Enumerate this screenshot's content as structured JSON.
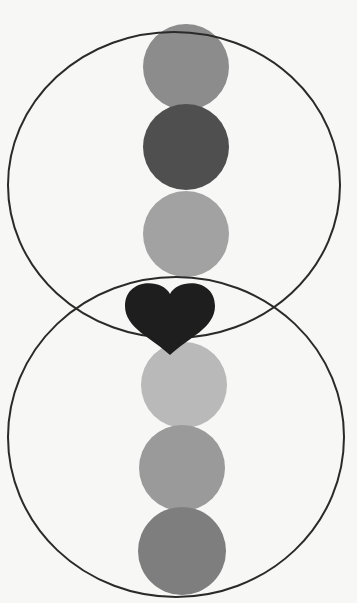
{
  "title": {
    "text": "",
    "note": "title text cropped at top edge, not legible"
  },
  "diagram": {
    "background": "#f7f7f6",
    "outlines": [
      {
        "name": "upper-ring",
        "cx": 174,
        "cy": 185,
        "rx": 166,
        "ry": 153,
        "stroke": "#2a2a2a"
      },
      {
        "name": "lower-ring",
        "cx": 176,
        "cy": 437,
        "rx": 168,
        "ry": 160,
        "stroke": "#2a2a2a"
      }
    ],
    "dots": [
      {
        "name": "dot-1",
        "cx": 186,
        "cy": 67,
        "r": 43,
        "fill": "#8c8c8c"
      },
      {
        "name": "dot-2",
        "cx": 186,
        "cy": 147,
        "r": 43,
        "fill": "#4f4f4f"
      },
      {
        "name": "dot-3",
        "cx": 186,
        "cy": 234,
        "r": 43,
        "fill": "#a2a2a2"
      },
      {
        "name": "dot-4",
        "cx": 184,
        "cy": 385,
        "r": 43,
        "fill": "#b9b9b9"
      },
      {
        "name": "dot-5",
        "cx": 182,
        "cy": 468,
        "r": 43,
        "fill": "#9a9a9a"
      },
      {
        "name": "dot-6",
        "cx": 182,
        "cy": 551,
        "r": 44,
        "fill": "#7e7e7e"
      }
    ],
    "heart": {
      "name": "heart",
      "cx": 170,
      "cy": 300,
      "fill": "#1e1e1e"
    }
  }
}
